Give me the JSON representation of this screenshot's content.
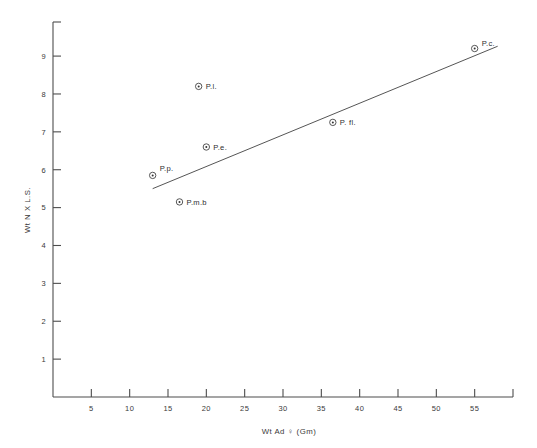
{
  "chart_data": {
    "type": "scatter",
    "title": "",
    "xlabel": "Wt Ad ♀ (Gm)",
    "ylabel": "Wt N X L.S.",
    "xlim": [
      0,
      60
    ],
    "ylim": [
      0,
      9.9
    ],
    "grid": false,
    "legend": "none",
    "xticks": [
      5,
      10,
      15,
      20,
      25,
      30,
      35,
      40,
      45,
      50,
      55
    ],
    "xticklabels": [
      "5",
      "10",
      "15",
      "20",
      "25",
      "30",
      "35",
      "40",
      "45",
      "50",
      "55"
    ],
    "yticks": [
      1,
      2,
      3,
      4,
      5,
      6,
      7,
      8,
      9
    ],
    "yticklabels": [
      "1",
      "2",
      "3",
      "4",
      "5",
      "6",
      "7",
      "8",
      "9"
    ],
    "points": [
      {
        "label": "P.p.",
        "x": 13.0,
        "y": 5.85,
        "label_dx": 7,
        "label_dy": -4
      },
      {
        "label": "P.m.b",
        "x": 16.5,
        "y": 5.15,
        "label_dx": 7,
        "label_dy": 3
      },
      {
        "label": "P.l.",
        "x": 19.0,
        "y": 8.2,
        "label_dx": 7,
        "label_dy": 3
      },
      {
        "label": "P.e.",
        "x": 20.0,
        "y": 6.6,
        "label_dx": 7,
        "label_dy": 3
      },
      {
        "label": "P. fl.",
        "x": 36.5,
        "y": 7.25,
        "label_dx": 7,
        "label_dy": 3
      },
      {
        "label": "P.c.",
        "x": 55.0,
        "y": 9.2,
        "label_dx": 7,
        "label_dy": -3
      }
    ],
    "trend_line": {
      "x_start": 13.0,
      "y_start": 5.5,
      "x_end": 58.0,
      "y_end": 9.26
    }
  },
  "colors": {
    "background": "#ffffff",
    "axis": "#4d4d4d",
    "text": "#3a3a3a",
    "marker": "#333333",
    "trend": "#555555"
  }
}
